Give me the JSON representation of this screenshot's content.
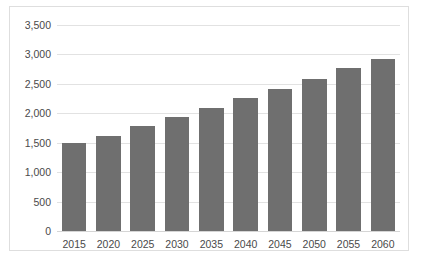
{
  "chart_data": {
    "type": "bar",
    "title": "",
    "subtitle": "",
    "xlabel": "",
    "ylabel": "",
    "categories": [
      "2015",
      "2020",
      "2025",
      "2030",
      "2035",
      "2040",
      "2045",
      "2050",
      "2055",
      "2060"
    ],
    "values": [
      1490,
      1620,
      1780,
      1930,
      2090,
      2260,
      2420,
      2590,
      2770,
      2930
    ],
    "series": [
      {
        "name": "",
        "values": [
          1490,
          1620,
          1780,
          1930,
          2090,
          2260,
          2420,
          2590,
          2770,
          2930
        ],
        "color": "#6f6f6f"
      }
    ],
    "ylim": [
      0,
      3500
    ],
    "y_ticks": [
      0,
      500,
      1000,
      1500,
      2000,
      2500,
      3000,
      3500
    ],
    "y_tick_labels": [
      "0",
      "500",
      "1,000",
      "1,500",
      "2,000",
      "2,500",
      "3,000",
      "3,500"
    ],
    "grid": true,
    "grid_axis": "y",
    "legend": false,
    "legend_position": "none",
    "annotations": [],
    "bar_color": "#6f6f6f",
    "gridline_color": "#e2e2e2",
    "border_color": "#dedede",
    "background_color": "#ffffff",
    "text_color": "#4a4a4a"
  }
}
